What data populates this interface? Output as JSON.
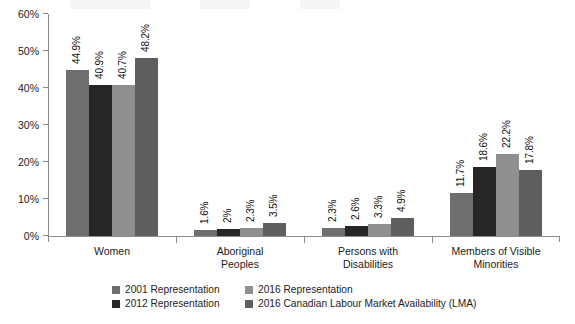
{
  "chart_data": {
    "type": "bar",
    "title": "",
    "subtitle": "",
    "xlabel": "",
    "ylabel": "",
    "ylim": [
      0,
      60
    ],
    "ytick_labels": [
      "0%",
      "10%",
      "20%",
      "30%",
      "40%",
      "50%",
      "60%"
    ],
    "ytick_values": [
      0,
      10,
      20,
      30,
      40,
      50,
      60
    ],
    "grid": false,
    "legend_position": "bottom",
    "categories": [
      "Women",
      "Aboriginal Peoples",
      "Persons with Disabilities",
      "Members of Visible Minorities"
    ],
    "category_lines": [
      [
        "Women"
      ],
      [
        "Aboriginal",
        "Peoples"
      ],
      [
        "Persons with",
        "Disabilities"
      ],
      [
        "Members of Visible",
        "Minorities"
      ]
    ],
    "series": [
      {
        "name": "2001 Representation",
        "color": "#6e6e6e",
        "values": [
          44.9,
          1.6,
          2.3,
          11.7
        ],
        "labels": [
          "44.9%",
          "1.6%",
          "2.3%",
          "11.7%"
        ]
      },
      {
        "name": "2012 Representation",
        "color": "#262626",
        "values": [
          40.9,
          2.0,
          2.6,
          18.6
        ],
        "labels": [
          "40.9%",
          "2%",
          "2.6%",
          "18.6%"
        ]
      },
      {
        "name": "2016 Representation",
        "color": "#8f8f8f",
        "values": [
          40.7,
          2.3,
          3.3,
          22.2
        ],
        "labels": [
          "40.7%",
          "2.3%",
          "3.3%",
          "22.2%"
        ]
      },
      {
        "name": "2016 Canadian Labour Market Availability (LMA)",
        "color": "#5f5f5f",
        "values": [
          48.2,
          3.5,
          4.9,
          17.8
        ],
        "labels": [
          "48.2%",
          "3.5%",
          "4.9%",
          "17.8%"
        ]
      }
    ]
  },
  "legend": {
    "items": [
      {
        "label": "2001 Representation",
        "color": "#6e6e6e"
      },
      {
        "label": "2016 Representation",
        "color": "#8f8f8f"
      },
      {
        "label": "2012 Representation",
        "color": "#262626"
      },
      {
        "label": "2016 Canadian Labour Market Availability (LMA)",
        "color": "#5f5f5f"
      }
    ]
  }
}
